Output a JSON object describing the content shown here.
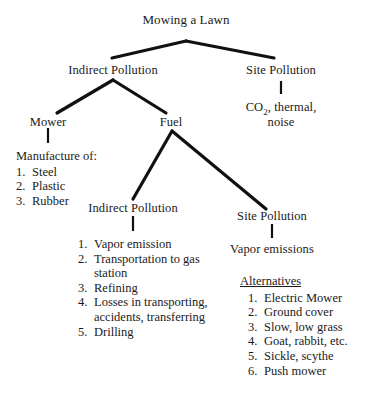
{
  "diagram": {
    "type": "tree",
    "title": "Mowing a Lawn",
    "nodes": {
      "root": "Mowing a Lawn",
      "indirect_pollution_1": "Indirect Pollution",
      "site_pollution_1": "Site Pollution",
      "site_pollution_1_detail": "CO2, thermal, noise",
      "site_pollution_1_detail_line1_a": "CO",
      "site_pollution_1_detail_line1_sub": "2",
      "site_pollution_1_detail_line1_b": ", thermal,",
      "site_pollution_1_detail_line2": "noise",
      "mower": "Mower",
      "fuel": "Fuel",
      "indirect_pollution_2": "Indirect Pollution",
      "site_pollution_2": "Site Pollution",
      "site_pollution_2_detail": "Vapor emissions"
    },
    "manufacture": {
      "heading": "Manufacture of:",
      "items": [
        {
          "num": "1.",
          "text": "Steel"
        },
        {
          "num": "2.",
          "text": "Plastic"
        },
        {
          "num": "3.",
          "text": "Rubber"
        }
      ]
    },
    "fuel_indirect_list": {
      "items": [
        {
          "num": "1.",
          "text": "Vapor emission"
        },
        {
          "num": "2.",
          "text": "Transportation to gas station"
        },
        {
          "num": "3.",
          "text": "Refining"
        },
        {
          "num": "4.",
          "text": "Losses in transporting, accidents, transferring"
        },
        {
          "num": "5.",
          "text": "Drilling"
        }
      ]
    },
    "alternatives": {
      "heading": "Alternatives",
      "items": [
        {
          "num": "1.",
          "text": "Electric Mower"
        },
        {
          "num": "2.",
          "text": "Ground cover"
        },
        {
          "num": "3.",
          "text": "Slow, low grass"
        },
        {
          "num": "4.",
          "text": "Goat, rabbit, etc."
        },
        {
          "num": "5.",
          "text": "Sickle, scythe"
        },
        {
          "num": "6.",
          "text": "Push mower"
        }
      ]
    },
    "colors": {
      "background": "#ffffff",
      "text": "#1a1a1a",
      "line": "#111111"
    }
  }
}
